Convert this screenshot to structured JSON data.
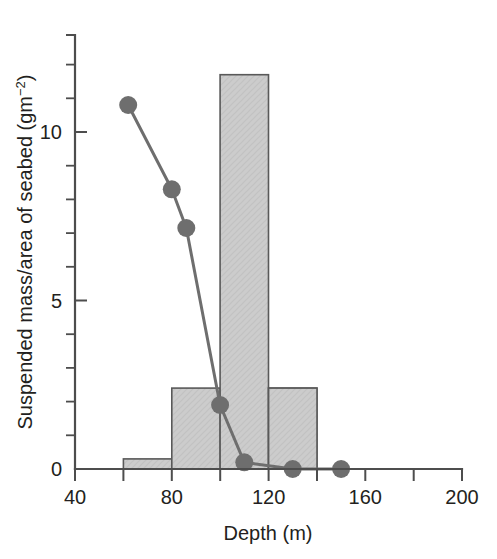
{
  "chart_data": {
    "type": "bar",
    "title": "",
    "subtitle": "",
    "xlabel": "Depth (m)",
    "ylabel": "Suspended mass/area of seabed (gm⁻²)",
    "ylabel_main": "Suspended mass/area of seabed (gm",
    "ylabel_sup": "−2",
    "ylabel_tail": ")",
    "xlim": [
      40,
      200
    ],
    "ylim": [
      0,
      12.6
    ],
    "grid": false,
    "legend": "none",
    "x_ticks": [
      40,
      60,
      80,
      100,
      120,
      140,
      160,
      180,
      200
    ],
    "x_tick_labels": [
      "40",
      "",
      "80",
      "",
      "120",
      "",
      "160",
      "",
      "200"
    ],
    "y_ticks": [
      0,
      1,
      2,
      3,
      4,
      5,
      6,
      7,
      8,
      9,
      10,
      11,
      12
    ],
    "y_tick_labels": [
      "0",
      "",
      "",
      "",
      "",
      "5",
      "",
      "",
      "",
      "",
      "10",
      "",
      ""
    ],
    "bars": {
      "name": "Seabed suspended mass histogram",
      "bin_edges": [
        40,
        60,
        80,
        100,
        120,
        140
      ],
      "bin_labels": [
        "40–60",
        "60–80",
        "80–100",
        "100–120",
        "120–140"
      ],
      "values": [
        0.7,
        0.3,
        2.4,
        11.7,
        2.4
      ],
      "fill_color": "#cccccc",
      "edge_color": "#595959"
    },
    "line_series": {
      "name": "Suspended mass profile",
      "x": [
        62,
        80,
        86,
        100,
        110,
        130,
        150
      ],
      "y": [
        10.8,
        8.3,
        7.15,
        1.9,
        0.2,
        0.0,
        0.0
      ],
      "color": "#6e6e6e",
      "marker": "filled-circle",
      "marker_size": 9
    }
  },
  "colors": {
    "axis": "#4d4d4d",
    "text": "#231f20",
    "bar_fill": "#cccccc",
    "bar_edge": "#595959",
    "series": "#6e6e6e",
    "background": "#ffffff"
  }
}
